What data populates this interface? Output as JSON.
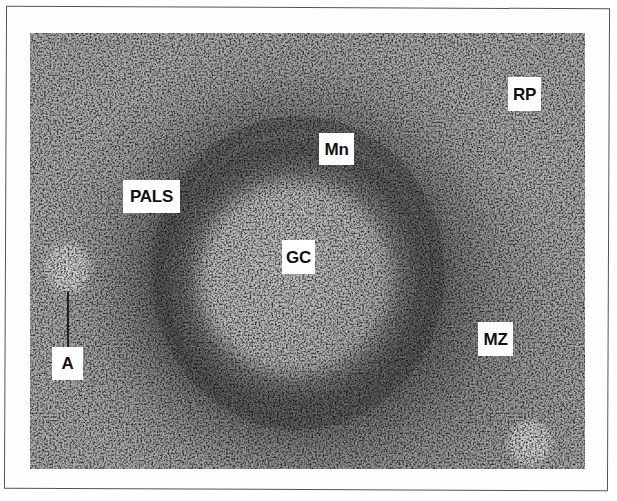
{
  "figure": {
    "style": "grayscale",
    "labels": [
      {
        "id": "RP",
        "text": "RP",
        "x": 508,
        "y": 77,
        "w": 33,
        "h": 34
      },
      {
        "id": "Mn",
        "text": "Mn",
        "x": 319,
        "y": 133,
        "w": 35,
        "h": 32
      },
      {
        "id": "PALS",
        "text": "PALS",
        "x": 123,
        "y": 180,
        "w": 57,
        "h": 33
      },
      {
        "id": "GC",
        "text": "GC",
        "x": 282,
        "y": 240,
        "w": 33,
        "h": 34
      },
      {
        "id": "MZ",
        "text": "MZ",
        "x": 478,
        "y": 322,
        "w": 35,
        "h": 34
      },
      {
        "id": "A",
        "text": "A",
        "x": 52,
        "y": 347,
        "w": 31,
        "h": 33
      }
    ],
    "colors": {
      "frame_border": "#555555",
      "label_bg": "#ffffff",
      "label_text": "#111111",
      "tissue_base": "#a6a6a6",
      "mantle_dark": "#4a4a4a",
      "germinal_light": "#b8b8b8"
    }
  }
}
